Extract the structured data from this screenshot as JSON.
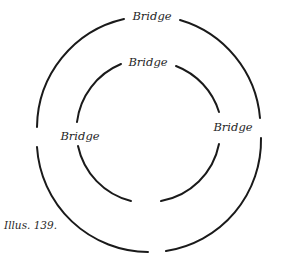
{
  "figure": {
    "caption": "Illus. 139.",
    "outer_ring": {
      "labels": {
        "top": "Bridge"
      }
    },
    "inner_ring": {
      "labels": {
        "top": "Bridge",
        "left": "Bridge",
        "right": "Bridge"
      }
    },
    "stroke_color": "#1a1a1a"
  }
}
